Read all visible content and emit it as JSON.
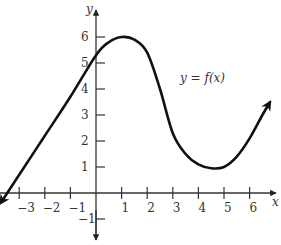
{
  "chart_data": {
    "type": "line",
    "title": "",
    "xlabel": "x",
    "ylabel": "y",
    "annotation": "y = f(x)",
    "x_ticks": [
      -3,
      -2,
      -1,
      1,
      2,
      3,
      4,
      5,
      6
    ],
    "y_ticks": [
      -1,
      1,
      2,
      3,
      4,
      5,
      6
    ],
    "x_tick_labels": [
      "−3",
      "−2",
      "−1",
      "1",
      "2",
      "3",
      "4",
      "5",
      "6"
    ],
    "y_tick_labels": [
      "−1",
      "1",
      "2",
      "3",
      "4",
      "5",
      "6"
    ],
    "xlim": [
      -3.7,
      7.2
    ],
    "ylim": [
      -1.6,
      6.8
    ],
    "grid": false,
    "series": [
      {
        "name": "f(x)",
        "x": [
          -3.6,
          -3.0,
          -2.0,
          -1.0,
          0.0,
          0.5,
          1.0,
          1.5,
          2.0,
          2.5,
          3.0,
          3.5,
          4.0,
          4.5,
          5.0,
          5.5,
          6.0,
          6.5,
          6.8
        ],
        "values": [
          -0.2,
          0.7,
          2.2,
          3.7,
          5.3,
          5.8,
          6.0,
          5.9,
          5.4,
          4.0,
          2.3,
          1.5,
          1.1,
          0.95,
          1.0,
          1.4,
          2.1,
          3.0,
          3.5
        ]
      }
    ],
    "endpoints": "arrows at both ends"
  },
  "labels": {
    "x_axis": "x",
    "y_axis": "y",
    "curve": "y = f(x)"
  }
}
